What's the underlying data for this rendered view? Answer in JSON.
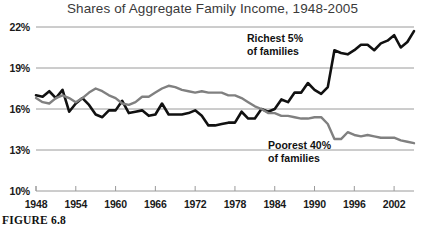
{
  "figure": {
    "caption": "FIGURE 6.8"
  },
  "chart_data": {
    "type": "line",
    "title": "Shares of Aggregate Family Income, 1948-2005",
    "xlabel": "",
    "ylabel": "",
    "xlim": [
      1948,
      2005
    ],
    "ylim": [
      10,
      22
    ],
    "grid": true,
    "gridlines_y": [
      10,
      13,
      16,
      19,
      22
    ],
    "ytick_labels": [
      "22%",
      "19%",
      "16%",
      "13%",
      "10%"
    ],
    "ytick_values": [
      22,
      19,
      16,
      13,
      10
    ],
    "xtick_values": [
      1948,
      1954,
      1960,
      1966,
      1972,
      1978,
      1984,
      1990,
      1996,
      2002
    ],
    "xtick_labels": [
      "1948",
      "1954",
      "1960",
      "1966",
      "1972",
      "1978",
      "1984",
      "1990",
      "1996",
      "2002"
    ],
    "legend_position": "inline-annotations",
    "x": [
      1948,
      1949,
      1950,
      1951,
      1952,
      1953,
      1954,
      1955,
      1956,
      1957,
      1958,
      1959,
      1960,
      1961,
      1962,
      1963,
      1964,
      1965,
      1966,
      1967,
      1968,
      1969,
      1970,
      1971,
      1972,
      1973,
      1974,
      1975,
      1976,
      1977,
      1978,
      1979,
      1980,
      1981,
      1982,
      1983,
      1984,
      1985,
      1986,
      1987,
      1988,
      1989,
      1990,
      1991,
      1992,
      1993,
      1994,
      1995,
      1996,
      1997,
      1998,
      1999,
      2000,
      2001,
      2002,
      2003,
      2004,
      2005
    ],
    "series": [
      {
        "name": "Richest 5% of families",
        "color": "#111111",
        "annotation": "Richest 5%\nof families",
        "values": [
          17.0,
          16.9,
          17.3,
          16.8,
          17.4,
          15.8,
          16.4,
          16.8,
          16.3,
          15.6,
          15.4,
          15.9,
          15.9,
          16.6,
          15.7,
          15.8,
          15.9,
          15.5,
          15.6,
          16.4,
          15.6,
          15.6,
          15.6,
          15.7,
          15.9,
          15.5,
          14.8,
          14.8,
          14.9,
          15.0,
          15.0,
          15.8,
          15.3,
          15.3,
          16.0,
          15.8,
          16.0,
          16.7,
          16.5,
          17.2,
          17.2,
          17.9,
          17.4,
          17.1,
          17.6,
          20.3,
          20.1,
          20.0,
          20.3,
          20.7,
          20.7,
          20.3,
          20.8,
          21.0,
          21.4,
          20.5,
          20.9,
          21.7
        ]
      },
      {
        "name": "Poorest 40% of families",
        "color": "#808080",
        "annotation": "Poorest 40%\nof families",
        "values": [
          16.8,
          16.5,
          16.4,
          16.8,
          17.0,
          16.8,
          16.5,
          16.8,
          17.2,
          17.5,
          17.3,
          17.0,
          16.8,
          16.4,
          16.3,
          16.5,
          16.9,
          16.9,
          17.2,
          17.5,
          17.7,
          17.6,
          17.4,
          17.3,
          17.2,
          17.3,
          17.2,
          17.2,
          17.2,
          17.0,
          17.0,
          16.8,
          16.5,
          16.2,
          16.0,
          15.7,
          15.7,
          15.5,
          15.5,
          15.4,
          15.3,
          15.3,
          15.4,
          15.4,
          14.9,
          13.8,
          13.8,
          14.3,
          14.1,
          14.0,
          14.1,
          14.0,
          13.9,
          13.9,
          13.9,
          13.7,
          13.6,
          13.5
        ]
      }
    ]
  }
}
